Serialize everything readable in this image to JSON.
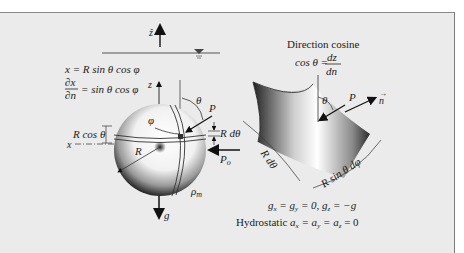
{
  "figure": {
    "type": "diagram",
    "colors": {
      "panel_background": "#ebebeb",
      "panel_border": "#8a8a8a",
      "ink": "#222222"
    },
    "left": {
      "free_surface_axis_label": "ẑ",
      "equation_x": "x = R sin θ cos φ",
      "derivative_numerator": "∂x",
      "derivative_denominator": "∂n",
      "derivative_rhs": "= sin θ cos φ",
      "z_axis_label": "z",
      "x_axis_label": "x",
      "phi_label": "φ",
      "theta_label": "θ",
      "point_label": "P",
      "r_dtheta_label": "R dθ",
      "r_cos_theta_label": "R cos θ",
      "radius_label": "R",
      "pressure_label_main": "P",
      "pressure_label_sub": "o",
      "density_label_main": "ρ",
      "density_label_sub": "m",
      "gravity_label": "g"
    },
    "right": {
      "title": "Direction cosine",
      "cos_lhs": "cos θ =",
      "cos_num": "dz",
      "cos_den": "dn",
      "theta_label": "θ",
      "point_label": "P",
      "normal_label": "n",
      "arc1_label": "R dθ",
      "arc2_label": "R sin θ dφ",
      "gravity_eq": "gx = gy = 0,  gz = −g",
      "gravity_eq_parts": {
        "a": "g",
        "a_sub": "x",
        "b": " = g",
        "b_sub": "y",
        "c": " = 0,  g",
        "c_sub": "z",
        "d": " = −g"
      },
      "hydro_prefix": "Hydrostatic ",
      "hydro_parts": {
        "a": "a",
        "a_sub": "x",
        "b": " = a",
        "b_sub": "y",
        "c": " = a",
        "c_sub": "z",
        "d": " = 0"
      }
    }
  }
}
